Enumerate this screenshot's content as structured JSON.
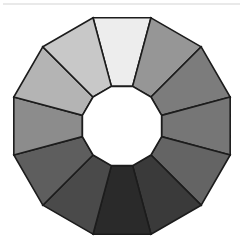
{
  "page": {
    "background_color": "#ffffff"
  },
  "top_rule": {
    "color": "#e9e9e9"
  },
  "chart_data": {
    "type": "pie",
    "subtitle": "",
    "variant": "donut-polygon",
    "shape": "dodecagon",
    "segment_count": 12,
    "stroke_color": "#1c1c1c",
    "stroke_width": 1.6,
    "hub_color": "#ffffff",
    "background_color": "#ffffff",
    "center": {
      "x": 122,
      "y": 120
    },
    "outer_radius": 112,
    "inner_radius": 41,
    "start_angle_deg": -105,
    "legend_position": "none",
    "grid": false,
    "categories": [
      "segment-1",
      "segment-2",
      "segment-3",
      "segment-4",
      "segment-5",
      "segment-6",
      "segment-7",
      "segment-8",
      "segment-9",
      "segment-10",
      "segment-11",
      "segment-12"
    ],
    "values": [
      30,
      30,
      30,
      30,
      30,
      30,
      30,
      30,
      30,
      30,
      30,
      30
    ],
    "colors": [
      "#ededed",
      "#969696",
      "#7c7c7c",
      "#767676",
      "#646464",
      "#3a3a3a",
      "#2a2a2a",
      "#4a4a4a",
      "#5e5e5e",
      "#8c8c8c",
      "#b4b4b4",
      "#c8c8c8"
    ],
    "xlabel": "",
    "ylabel": ""
  }
}
